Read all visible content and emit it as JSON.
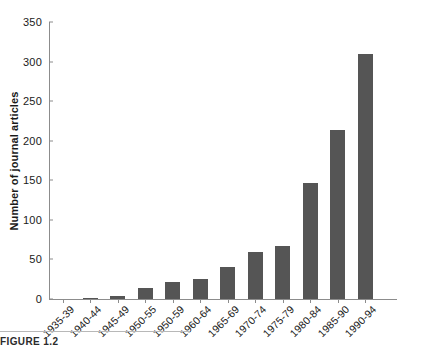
{
  "chart_data": {
    "type": "bar",
    "title": "",
    "xlabel": "",
    "ylabel": "Number of journal articles",
    "ylim": [
      0,
      350
    ],
    "yticks": [
      0,
      50,
      100,
      150,
      200,
      250,
      300,
      350
    ],
    "grid": false,
    "legend": null,
    "bar_color": "#555555",
    "axis_color": "#8c8c8c",
    "categories": [
      "1935-39",
      "1940-44",
      "1945-49",
      "1950-55",
      "1950-59",
      "1960-64",
      "1965-69",
      "1970-74",
      "1975-79",
      "1980-84",
      "1985-90",
      "1990-94"
    ],
    "values": [
      0,
      1,
      4,
      14,
      21,
      25,
      40,
      59,
      67,
      146,
      214,
      309
    ]
  },
  "caption": {
    "text": "FIGURE 1.2"
  }
}
